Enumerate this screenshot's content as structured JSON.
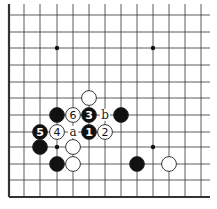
{
  "board": {
    "x_lines": [
      9,
      24,
      40,
      57,
      73,
      89,
      105,
      121,
      137,
      153,
      169,
      185,
      201
    ],
    "y_lines": [
      15,
      32,
      48,
      65,
      82,
      98,
      115,
      132,
      147,
      164,
      180,
      197
    ],
    "right_extent": 210,
    "top_extent": 4,
    "edges": [
      "left",
      "bottom"
    ],
    "star_points": [
      [
        57,
        48
      ],
      [
        153,
        48
      ],
      [
        57,
        147
      ],
      [
        153,
        147
      ]
    ]
  },
  "stones": [
    {
      "color": "white",
      "x": 89,
      "y": 98,
      "label": ""
    },
    {
      "color": "black",
      "x": 57,
      "y": 115,
      "label": ""
    },
    {
      "color": "white",
      "x": 73,
      "y": 115,
      "label": "6"
    },
    {
      "color": "black",
      "x": 89,
      "y": 115,
      "label": "3"
    },
    {
      "color": "black",
      "x": 121,
      "y": 115,
      "label": ""
    },
    {
      "color": "black",
      "x": 40,
      "y": 132,
      "label": "5"
    },
    {
      "color": "white",
      "x": 57,
      "y": 132,
      "label": "4"
    },
    {
      "color": "black",
      "x": 89,
      "y": 132,
      "label": "1"
    },
    {
      "color": "white",
      "x": 105,
      "y": 132,
      "label": "2"
    },
    {
      "color": "black",
      "x": 40,
      "y": 147,
      "label": ""
    },
    {
      "color": "white",
      "x": 73,
      "y": 147,
      "label": ""
    },
    {
      "color": "black",
      "x": 57,
      "y": 164,
      "label": ""
    },
    {
      "color": "white",
      "x": 73,
      "y": 164,
      "label": ""
    },
    {
      "color": "black",
      "x": 137,
      "y": 164,
      "label": ""
    },
    {
      "color": "white",
      "x": 169,
      "y": 164,
      "label": ""
    }
  ],
  "point_labels": [
    {
      "text": "b",
      "x": 105,
      "y": 115
    },
    {
      "text": "a",
      "x": 73,
      "y": 132
    }
  ]
}
